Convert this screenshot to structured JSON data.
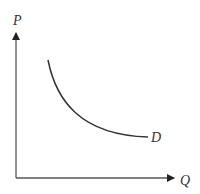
{
  "diagram": {
    "y_axis_label": "P",
    "x_axis_label": "Q",
    "curve_label": "D",
    "colors": {
      "axis": "#555555",
      "curve": "#333333",
      "text": "#333333"
    }
  }
}
